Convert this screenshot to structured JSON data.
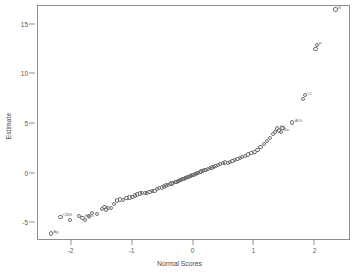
{
  "figure": {
    "title_cropped": "",
    "background": "#ffffff",
    "frame_color": "#8e8e8e",
    "marker_color": "#6f6f6f",
    "text_color": "#5a5a5a"
  },
  "chart_data": {
    "type": "scatter",
    "title": "",
    "xlabel": "Normal Scores",
    "ylabel": "Estimate",
    "xlim": [
      -2.55,
      2.55
    ],
    "ylim": [
      -6.6,
      16.9
    ],
    "xticks": [
      -2,
      -1,
      0,
      1,
      2
    ],
    "xticklabels": [
      "-2",
      "-1",
      "0",
      "1",
      "2"
    ],
    "yticks": [
      -5,
      0,
      5,
      10,
      15
    ],
    "yticklabels": [
      "-5",
      "0",
      "5",
      "10",
      "15"
    ],
    "grid": false,
    "legend": false,
    "marker": "open-circle",
    "series": [
      {
        "name": "Estimate vs Normal Scores",
        "points": [
          {
            "x": -2.34,
            "y": -6.05,
            "label": "Ag"
          },
          {
            "x": -2.18,
            "y": -4.38,
            "label": "CBG"
          },
          {
            "x": -2.02,
            "y": -4.72,
            "label": ""
          },
          {
            "x": -1.88,
            "y": -4.3,
            "label": ""
          },
          {
            "x": -1.82,
            "y": -4.45,
            "label": "EFG"
          },
          {
            "x": -1.78,
            "y": -4.68,
            "label": "Bi"
          },
          {
            "x": -1.72,
            "y": -4.3,
            "label": ""
          },
          {
            "x": -1.66,
            "y": -4.0,
            "label": ""
          },
          {
            "x": -1.58,
            "y": -4.05,
            "label": ""
          },
          {
            "x": -1.5,
            "y": -3.55,
            "label": ""
          },
          {
            "x": -1.46,
            "y": -3.4,
            "label": ""
          },
          {
            "x": -1.43,
            "y": -3.62,
            "label": ""
          },
          {
            "x": -1.4,
            "y": -3.5,
            "label": ""
          },
          {
            "x": -1.35,
            "y": -3.45,
            "label": ""
          },
          {
            "x": -1.3,
            "y": -3.08,
            "label": ""
          },
          {
            "x": -1.25,
            "y": -2.72,
            "label": ""
          },
          {
            "x": -1.2,
            "y": -2.62,
            "label": ""
          },
          {
            "x": -1.15,
            "y": -2.65,
            "label": ""
          },
          {
            "x": -1.1,
            "y": -2.5,
            "label": ""
          },
          {
            "x": -1.05,
            "y": -2.42,
            "label": ""
          },
          {
            "x": -1.0,
            "y": -2.35,
            "label": ""
          },
          {
            "x": -0.96,
            "y": -2.22,
            "label": ""
          },
          {
            "x": -0.92,
            "y": -2.12,
            "label": ""
          },
          {
            "x": -0.88,
            "y": -2.02,
            "label": ""
          },
          {
            "x": -0.84,
            "y": -2.0,
            "label": ""
          },
          {
            "x": -0.8,
            "y": -1.95,
            "label": ""
          },
          {
            "x": -0.76,
            "y": -1.92,
            "label": ""
          },
          {
            "x": -0.72,
            "y": -1.85,
            "label": ""
          },
          {
            "x": -0.68,
            "y": -1.78,
            "label": ""
          },
          {
            "x": -0.64,
            "y": -1.72,
            "label": ""
          },
          {
            "x": -0.6,
            "y": -1.55,
            "label": ""
          },
          {
            "x": -0.56,
            "y": -1.45,
            "label": ""
          },
          {
            "x": -0.52,
            "y": -1.4,
            "label": ""
          },
          {
            "x": -0.48,
            "y": -1.3,
            "label": ""
          },
          {
            "x": -0.45,
            "y": -1.2,
            "label": ""
          },
          {
            "x": -0.42,
            "y": -1.12,
            "label": ""
          },
          {
            "x": -0.39,
            "y": -1.05,
            "label": ""
          },
          {
            "x": -0.36,
            "y": -1.0,
            "label": ""
          },
          {
            "x": -0.33,
            "y": -0.95,
            "label": ""
          },
          {
            "x": -0.3,
            "y": -0.88,
            "label": ""
          },
          {
            "x": -0.28,
            "y": -0.82,
            "label": ""
          },
          {
            "x": -0.26,
            "y": -0.78,
            "label": ""
          },
          {
            "x": -0.24,
            "y": -0.72,
            "label": ""
          },
          {
            "x": -0.22,
            "y": -0.68,
            "label": ""
          },
          {
            "x": -0.2,
            "y": -0.62,
            "label": ""
          },
          {
            "x": -0.18,
            "y": -0.58,
            "label": ""
          },
          {
            "x": -0.16,
            "y": -0.52,
            "label": ""
          },
          {
            "x": -0.14,
            "y": -0.48,
            "label": ""
          },
          {
            "x": -0.12,
            "y": -0.42,
            "label": ""
          },
          {
            "x": -0.1,
            "y": -0.38,
            "label": ""
          },
          {
            "x": -0.08,
            "y": -0.32,
            "label": ""
          },
          {
            "x": -0.06,
            "y": -0.28,
            "label": ""
          },
          {
            "x": -0.04,
            "y": -0.22,
            "label": ""
          },
          {
            "x": -0.02,
            "y": -0.18,
            "label": ""
          },
          {
            "x": 0.0,
            "y": -0.12,
            "label": ""
          },
          {
            "x": 0.02,
            "y": -0.08,
            "label": ""
          },
          {
            "x": 0.04,
            "y": -0.02,
            "label": ""
          },
          {
            "x": 0.06,
            "y": 0.04,
            "label": ""
          },
          {
            "x": 0.08,
            "y": 0.08,
            "label": ""
          },
          {
            "x": 0.1,
            "y": 0.14,
            "label": ""
          },
          {
            "x": 0.12,
            "y": 0.2,
            "label": ""
          },
          {
            "x": 0.15,
            "y": 0.26,
            "label": ""
          },
          {
            "x": 0.18,
            "y": 0.32,
            "label": ""
          },
          {
            "x": 0.21,
            "y": 0.4,
            "label": ""
          },
          {
            "x": 0.24,
            "y": 0.48,
            "label": ""
          },
          {
            "x": 0.27,
            "y": 0.55,
            "label": ""
          },
          {
            "x": 0.3,
            "y": 0.62,
            "label": ""
          },
          {
            "x": 0.33,
            "y": 0.7,
            "label": ""
          },
          {
            "x": 0.36,
            "y": 0.78,
            "label": ""
          },
          {
            "x": 0.4,
            "y": 0.85,
            "label": ""
          },
          {
            "x": 0.44,
            "y": 0.95,
            "label": ""
          },
          {
            "x": 0.48,
            "y": 1.05,
            "label": ""
          },
          {
            "x": 0.52,
            "y": 1.12,
            "label": ""
          },
          {
            "x": 0.56,
            "y": 1.1,
            "label": ""
          },
          {
            "x": 0.6,
            "y": 1.15,
            "label": ""
          },
          {
            "x": 0.64,
            "y": 1.25,
            "label": ""
          },
          {
            "x": 0.68,
            "y": 1.35,
            "label": ""
          },
          {
            "x": 0.72,
            "y": 1.45,
            "label": ""
          },
          {
            "x": 0.76,
            "y": 1.55,
            "label": ""
          },
          {
            "x": 0.8,
            "y": 1.68,
            "label": ""
          },
          {
            "x": 0.85,
            "y": 1.8,
            "label": ""
          },
          {
            "x": 0.9,
            "y": 1.92,
            "label": ""
          },
          {
            "x": 0.95,
            "y": 2.05,
            "label": ""
          },
          {
            "x": 1.0,
            "y": 2.2,
            "label": ""
          },
          {
            "x": 1.05,
            "y": 2.4,
            "label": ""
          },
          {
            "x": 1.1,
            "y": 2.7,
            "label": ""
          },
          {
            "x": 1.15,
            "y": 2.95,
            "label": ""
          },
          {
            "x": 1.2,
            "y": 3.3,
            "label": ""
          },
          {
            "x": 1.25,
            "y": 3.6,
            "label": ""
          },
          {
            "x": 1.3,
            "y": 3.95,
            "label": ""
          },
          {
            "x": 1.34,
            "y": 4.2,
            "label": ""
          },
          {
            "x": 1.37,
            "y": 4.55,
            "label": "Pd"
          },
          {
            "x": 1.4,
            "y": 4.35,
            "label": ""
          },
          {
            "x": 1.43,
            "y": 4.2,
            "label": "Mo"
          },
          {
            "x": 1.46,
            "y": 4.6,
            "label": ""
          },
          {
            "x": 1.62,
            "y": 5.15,
            "label": "AlG"
          },
          {
            "x": 1.79,
            "y": 7.5,
            "label": ""
          },
          {
            "x": 1.83,
            "y": 7.9,
            "label": "Cl"
          },
          {
            "x": 2.0,
            "y": 12.6,
            "label": ""
          },
          {
            "x": 2.02,
            "y": 12.95,
            "label": "F"
          },
          {
            "x": 2.33,
            "y": 16.55,
            "label": "B"
          }
        ]
      }
    ]
  }
}
